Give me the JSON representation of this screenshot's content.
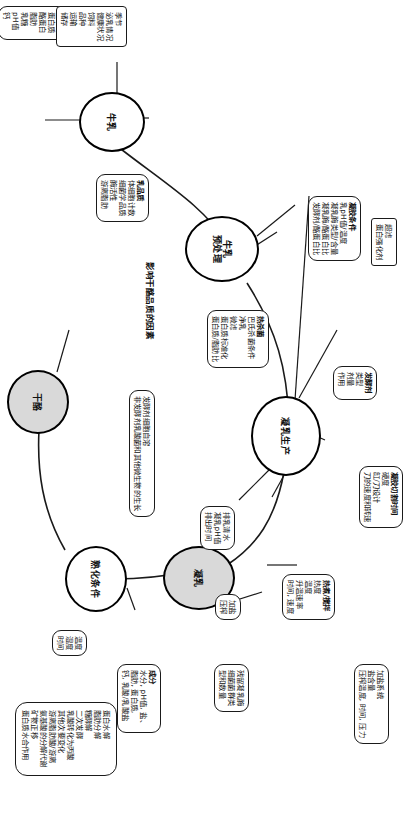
{
  "diagram": {
    "title": "影响干酪品质的因素",
    "type": "mind-map",
    "orientation": "rotated-90",
    "hubs": [
      {
        "id": "milk",
        "label": "牛乳",
        "shaded": false
      },
      {
        "id": "pretreat",
        "label": "牛乳\n预处理",
        "shaded": false
      },
      {
        "id": "curd_prod",
        "label": "凝乳生产",
        "shaded": false
      },
      {
        "id": "curd",
        "label": "凝乳",
        "shaded": true
      },
      {
        "id": "ripening",
        "label": "熟化条件",
        "shaded": false
      },
      {
        "id": "cheese",
        "label": "干酪",
        "shaded": true
      }
    ],
    "nodes": [
      {
        "id": "milk_comp",
        "head": "乳成分",
        "lines": [
          "蛋白质",
          "酪蛋白",
          "脂肪",
          "乳糖",
          "pH值",
          "钙"
        ]
      },
      {
        "id": "milk_quality",
        "head": "乳品质",
        "lines": [
          "体细胞计数",
          "细菌学品质",
          "酶活性",
          "游离脂肪"
        ]
      },
      {
        "id": "milk_source",
        "head": "",
        "lines": [
          "季节",
          "泌乳情况",
          "健康状况",
          "饲料",
          "品种",
          "运输",
          "储存"
        ]
      },
      {
        "id": "heat_treat",
        "head": "热杀菌",
        "lines": [
          "巴氏杀菌条件",
          "净乳",
          "微滤",
          "蛋白质标准化",
          "蛋白质/脂肪比"
        ]
      },
      {
        "id": "ultrafilt",
        "head": "",
        "lines": [
          "超滤",
          "蛋白强化剂"
        ]
      },
      {
        "id": "gel_cond",
        "head": "凝胶条件",
        "lines": [
          "乳pH值/温度",
          "凝乳酶类型/含量",
          "凝乳酶/酪蛋白比",
          "发酵剂/酪蛋白比"
        ]
      },
      {
        "id": "starter",
        "head": "发酵剂",
        "lines": [
          "类型",
          "剂量",
          "作用"
        ]
      },
      {
        "id": "gel_cut",
        "head": "凝胶切割时间",
        "lines": [
          "硬度",
          "缸/刀设计",
          "刀的速度和转速"
        ]
      },
      {
        "id": "cook_stir",
        "head": "热煮/搅拌",
        "lines": [
          "热度",
          "温度",
          "升温速率",
          "时间, 速度"
        ]
      },
      {
        "id": "whey_drain",
        "head": "",
        "lines": [
          "排乳清水",
          "凝乳pH值",
          "排出时间"
        ]
      },
      {
        "id": "salt_press",
        "head": "",
        "lines": [
          "加盐",
          "压榨"
        ]
      },
      {
        "id": "salt_system",
        "head": "",
        "lines": [
          "加盐系统",
          "盐含量",
          "压榨温度, 时间, 压力"
        ]
      },
      {
        "id": "residual",
        "head": "",
        "lines": [
          "残留凝乳酶",
          "细菌菌群类",
          "型和数量"
        ]
      },
      {
        "id": "composition",
        "head": "成分",
        "lines": [
          "水分, pH值, 盐、",
          "脂肪, 蛋白质,",
          "钙, 乳酸/乳酸盐"
        ]
      },
      {
        "id": "temp_hum",
        "head": "",
        "lines": [
          "温度",
          "湿度",
          "时间"
        ]
      },
      {
        "id": "microbes",
        "head": "",
        "lines": [
          "发酵剂细胞自溶",
          "非发酵剂乳酸菌和其他微生物的生长"
        ]
      },
      {
        "id": "biochem",
        "head": "",
        "lines": [
          "蛋白水解",
          "脂肪分解",
          "糖酵解",
          "二次发酵",
          "乳酸转化为丙酸",
          "其他次要变化",
          "游离脂肪酸/游离",
          "氨基酸的分解代谢",
          "矿物正移",
          "蛋白质水合作用"
        ]
      }
    ]
  }
}
